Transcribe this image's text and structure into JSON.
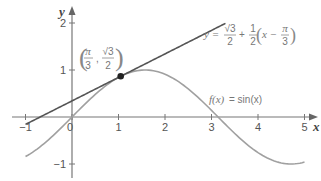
{
  "chart_data": {
    "type": "line",
    "title": "",
    "xlabel": "x",
    "ylabel": "y",
    "xlim": [
      -1.1,
      5.3
    ],
    "ylim": [
      -1.3,
      2.2
    ],
    "grid": false,
    "x_ticks": [
      -1,
      0,
      1,
      2,
      3,
      4,
      5
    ],
    "x_tick_labels": [
      "−1",
      "0",
      "1",
      "2",
      "3",
      "4",
      "5"
    ],
    "y_ticks": [
      -1,
      1,
      2
    ],
    "y_tick_labels": [
      "−1",
      "1",
      "2"
    ],
    "series": [
      {
        "name": "f(x) = sin(x)",
        "function": "sin(x)",
        "domain": [
          -1,
          5
        ],
        "color": "#a0a0a0"
      },
      {
        "name": "y = √3/2 + 1/2(x − π/3)",
        "function": "sqrt(3)/2 + 0.5*(x - pi/3)",
        "domain": [
          -1,
          3.3
        ],
        "color": "#555555"
      }
    ],
    "points": [
      {
        "label": "(π/3, √3/2)",
        "x": 1.0472,
        "y": 0.866,
        "color": "#222222"
      }
    ],
    "annotations": {
      "tangent_label": "y = √3/2 + 1/2(x − π/3)",
      "curve_label": "f(x) = sin(x)",
      "point_label": "(π/3, √3/2)"
    }
  },
  "labels": {
    "x_axis": "x",
    "y_axis": "y",
    "origin": "0",
    "curve_fx": "f(x)",
    "curve_eq": "= sin(x)",
    "tangent_y": "y =",
    "frac_sqrt3": "√3",
    "frac_2": "2",
    "frac_1": "1",
    "frac_pi": "π",
    "frac_3": "3",
    "plus": "+",
    "x_minus": "x −"
  }
}
